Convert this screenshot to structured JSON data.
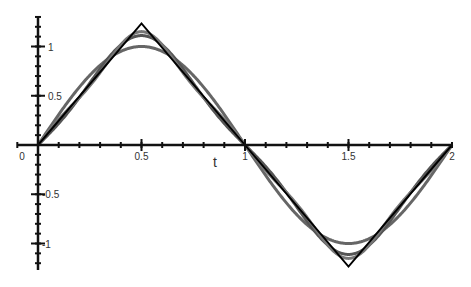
{
  "chart_data": {
    "type": "line",
    "title": "",
    "xlabel": "t",
    "ylabel": "",
    "xlim": [
      -0.1,
      2.0
    ],
    "ylim": [
      -1.27,
      1.3
    ],
    "grid": false,
    "legend": null,
    "x_ticks": [
      {
        "value": 0,
        "label": "0"
      },
      {
        "value": 0.5,
        "label": "0.5"
      },
      {
        "value": 1,
        "label": "1"
      },
      {
        "value": 1.5,
        "label": "1.5"
      },
      {
        "value": 2,
        "label": "2"
      }
    ],
    "y_ticks": [
      {
        "value": 1,
        "label": "1"
      },
      {
        "value": 0.5,
        "label": "0.5"
      },
      {
        "value": -0.5,
        "label": "-0.5"
      },
      {
        "value": -1,
        "label": "-1"
      }
    ],
    "x_minor_step": 0.1,
    "y_minor_step": 0.1,
    "series": [
      {
        "name": "1 term",
        "color": "#666666",
        "width": 3,
        "harmonics": 1
      },
      {
        "name": "2 terms",
        "color": "#555555",
        "width": 3,
        "harmonics": 2
      },
      {
        "name": "3 terms",
        "color": "#777777",
        "width": 3,
        "harmonics": 3
      },
      {
        "name": "triangle wave",
        "color": "#000000",
        "width": 2,
        "harmonics": 0,
        "x": [
          0,
          0.5,
          1.5,
          2
        ],
        "y": [
          0,
          1.234,
          -1.234,
          0
        ]
      }
    ],
    "sample_points": {
      "t": [
        0,
        0.25,
        0.5,
        0.75,
        1,
        1.25,
        1.5,
        1.75,
        2
      ],
      "triangle": [
        0,
        0.617,
        1.234,
        0.617,
        0,
        -0.617,
        -1.234,
        -0.617,
        0
      ],
      "one_term": [
        0,
        0.707,
        1.0,
        0.707,
        0,
        -0.707,
        -1.0,
        -0.707,
        0
      ]
    }
  }
}
